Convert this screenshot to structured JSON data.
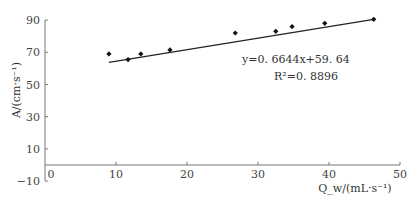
{
  "chart_data": {
    "type": "scatter",
    "title": "",
    "xlabel": "Q_w/(mL·s⁻¹)",
    "ylabel": "A/(cm·s⁻¹)",
    "xlim": [
      0,
      50
    ],
    "ylim": [
      -10,
      90
    ],
    "x_ticks": [
      "0",
      "10",
      "20",
      "30",
      "40",
      "50"
    ],
    "y_ticks": [
      "-10",
      "10",
      "30",
      "50",
      "70",
      "90"
    ],
    "grid": false,
    "legend": null,
    "series": [
      {
        "name": "measured",
        "marker": "diamond",
        "points": [
          {
            "x": 9.0,
            "y": 69.0
          },
          {
            "x": 11.7,
            "y": 65.5
          },
          {
            "x": 13.5,
            "y": 69.0
          },
          {
            "x": 17.6,
            "y": 71.5
          },
          {
            "x": 26.8,
            "y": 82.0
          },
          {
            "x": 32.5,
            "y": 83.0
          },
          {
            "x": 34.8,
            "y": 86.0
          },
          {
            "x": 39.4,
            "y": 88.0
          },
          {
            "x": 46.3,
            "y": 90.5
          }
        ]
      }
    ],
    "trendline": {
      "slope": 0.6644,
      "intercept": 59.64,
      "x_range": [
        9.0,
        46.3
      ]
    },
    "annotations": {
      "equation": "y=0.6644x+59.64",
      "r2": "R²=0.8896"
    }
  }
}
